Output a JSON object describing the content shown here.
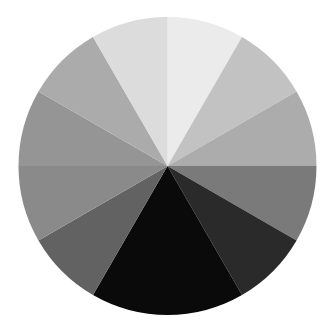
{
  "chart_data": {
    "type": "pie",
    "title": "",
    "legend": null,
    "labels_shown": false,
    "start_angle_deg": 0,
    "direction": "clockwise",
    "center": [
      167.5,
      166
    ],
    "radius": 149,
    "slices": [
      {
        "label": "",
        "value": 8.33,
        "angle_deg": 30,
        "color": "#ebebeb"
      },
      {
        "label": "",
        "value": 8.33,
        "angle_deg": 30,
        "color": "#c2c2c2"
      },
      {
        "label": "",
        "value": 8.33,
        "angle_deg": 30,
        "color": "#acacac"
      },
      {
        "label": "",
        "value": 8.33,
        "angle_deg": 30,
        "color": "#7a7a7a"
      },
      {
        "label": "",
        "value": 8.33,
        "angle_deg": 30,
        "color": "#2a2a2a"
      },
      {
        "label": "",
        "value": 16.67,
        "angle_deg": 60,
        "color": "#0a0a0a"
      },
      {
        "label": "",
        "value": 8.33,
        "angle_deg": 30,
        "color": "#626262"
      },
      {
        "label": "",
        "value": 8.33,
        "angle_deg": 30,
        "color": "#8a8a8a"
      },
      {
        "label": "",
        "value": 8.33,
        "angle_deg": 30,
        "color": "#959595"
      },
      {
        "label": "",
        "value": 8.33,
        "angle_deg": 30,
        "color": "#ababab"
      },
      {
        "label": "",
        "value": 8.33,
        "angle_deg": 30,
        "color": "#dcdcdc"
      }
    ]
  }
}
